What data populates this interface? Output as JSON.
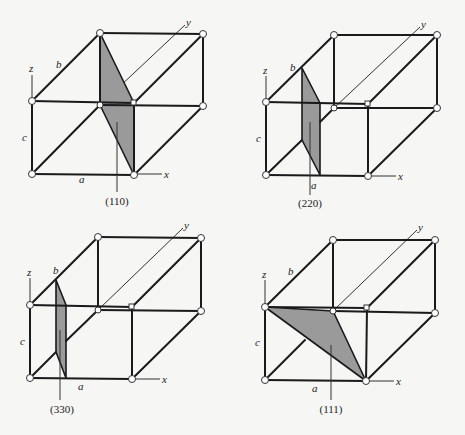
{
  "figure": {
    "panels": [
      {
        "id": "p110",
        "caption": "(110)",
        "labels": {
          "x": "x",
          "y": "y",
          "z": "z",
          "a": "a",
          "b": "b",
          "c": "c"
        },
        "plane_type": "rectangle-diagonal"
      },
      {
        "id": "p220",
        "caption": "(220)",
        "labels": {
          "x": "x",
          "y": "y",
          "z": "z",
          "a": "a",
          "b": "b",
          "c": "c"
        },
        "plane_type": "rectangle-diagonal-half"
      },
      {
        "id": "p330",
        "caption": "(330)",
        "labels": {
          "x": "x",
          "y": "y",
          "z": "z",
          "a": "a",
          "b": "b",
          "c": "c"
        },
        "plane_type": "rectangle-diagonal-third"
      },
      {
        "id": "p111",
        "caption": "(111)",
        "labels": {
          "x": "x",
          "y": "y",
          "z": "z",
          "a": "a",
          "b": "b",
          "c": "c"
        },
        "plane_type": "triangle"
      }
    ],
    "colors": {
      "plane_fill": "#9a9a9a",
      "edge": "#1a1a1a",
      "background": "#f6f6f4"
    }
  }
}
